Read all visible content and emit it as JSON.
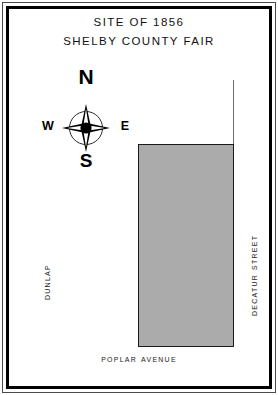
{
  "figure": {
    "name": "site-of-1856-shelby-county-fair-map",
    "background_color": "#ffffff"
  },
  "title": {
    "line1": "SITE OF 1856",
    "line2": "SHELBY COUNTY FAIR"
  },
  "compass": {
    "north": "N",
    "south": "S",
    "east": "E",
    "west": "W",
    "rose_icon": "compass-rose-four-point-star"
  },
  "parcel": {
    "label": "",
    "fill_color": "#ababab",
    "border_color": "#1a1a1a"
  },
  "streets": {
    "west": "Dunlap",
    "east": "Decatur Street",
    "south": "Poplar Avenue"
  },
  "frame": {
    "outer_color": "#4a4a4a",
    "inner_color": "#000000"
  }
}
